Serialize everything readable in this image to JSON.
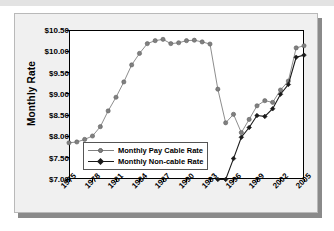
{
  "chart_data": {
    "type": "line",
    "title": "",
    "xlabel": "",
    "ylabel": "Monthly Rate",
    "ylim": [
      7.0,
      10.5
    ],
    "xlim": [
      1975,
      2005
    ],
    "grid": false,
    "legend_position": "inside-bottom-left",
    "ytick_labels": [
      "$10.50",
      "$10.00",
      "$9.50",
      "$9.00",
      "$8.50",
      "$8.00",
      "$7.50",
      "$7.00"
    ],
    "ytick_values": [
      10.5,
      10.0,
      9.5,
      9.0,
      8.5,
      8.0,
      7.5,
      7.0
    ],
    "xtick_labels": [
      "1975",
      "1978",
      "1981",
      "1984",
      "1987",
      "1990",
      "1993",
      "1996",
      "1999",
      "2002",
      "2005"
    ],
    "xtick_values": [
      1975,
      1978,
      1981,
      1984,
      1987,
      1990,
      1993,
      1996,
      1999,
      2002,
      2005
    ],
    "x": [
      1975,
      1976,
      1977,
      1978,
      1979,
      1980,
      1981,
      1982,
      1983,
      1984,
      1985,
      1986,
      1987,
      1988,
      1989,
      1990,
      1991,
      1992,
      1993,
      1994,
      1995,
      1996,
      1997,
      1998,
      1999,
      2000,
      2001,
      2002,
      2003,
      2004,
      2005
    ],
    "series": [
      {
        "name": "Monthly Pay Cable Rate",
        "color": "#808080",
        "marker": "circle",
        "values": [
          7.85,
          7.87,
          7.93,
          8.01,
          8.23,
          8.6,
          8.92,
          9.28,
          9.68,
          9.95,
          10.18,
          10.25,
          10.28,
          10.18,
          10.2,
          10.25,
          10.26,
          10.22,
          10.17,
          9.11,
          8.32,
          8.52,
          8.09,
          8.4,
          8.72,
          8.84,
          8.8,
          9.09,
          9.3,
          10.08,
          10.13
        ]
      },
      {
        "name": "Monthly Non-cable Rate",
        "color": "#1a1a1a",
        "marker": "diamond",
        "values": [
          null,
          null,
          null,
          null,
          null,
          null,
          null,
          null,
          null,
          null,
          null,
          null,
          null,
          null,
          null,
          null,
          null,
          null,
          null,
          6.99,
          6.99,
          7.48,
          7.98,
          8.21,
          8.49,
          8.47,
          8.65,
          8.99,
          9.22,
          9.86,
          9.91
        ]
      }
    ]
  },
  "legend": {
    "items": [
      {
        "label": "Monthly Pay Cable Rate"
      },
      {
        "label": "Monthly Non-cable Rate"
      }
    ]
  },
  "axes": {
    "y_axis_title": "Monthly Rate"
  }
}
